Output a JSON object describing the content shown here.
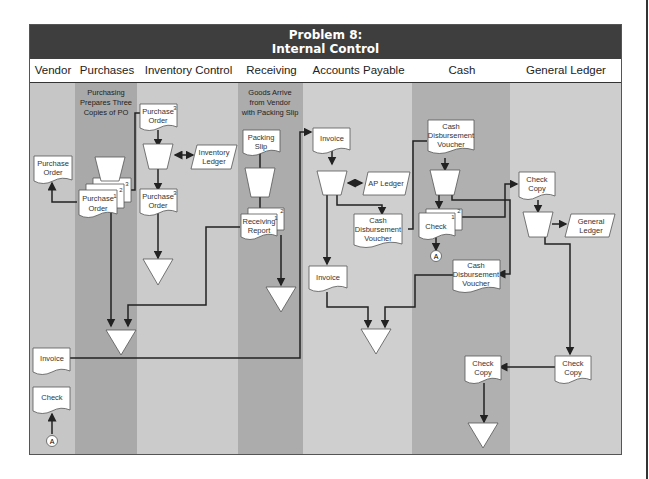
{
  "title": {
    "line1": "Problem 8:",
    "line2": "Internal Control"
  },
  "lanes": [
    {
      "label": "Vendor",
      "x": 29,
      "w": 46,
      "color": "#c6c6c6"
    },
    {
      "label": "Purchases",
      "x": 75,
      "w": 62,
      "color": "#a9a9a9"
    },
    {
      "label": "Inventory Control",
      "x": 137,
      "w": 101,
      "color": "#cbcbcb"
    },
    {
      "label": "Receiving",
      "x": 238,
      "w": 65,
      "color": "#acacac"
    },
    {
      "label": "Accounts Payable",
      "x": 303,
      "w": 109,
      "color": "#cfcfcf"
    },
    {
      "label": "Cash Disbursments",
      "x": 412,
      "w": 98,
      "color": "#b0b0b0"
    },
    {
      "label": "General Ledger",
      "x": 510,
      "w": 112,
      "color": "#cecece"
    }
  ],
  "notes": {
    "purchasing": [
      "Purchasing",
      "Prepares Three",
      "Copies of PO"
    ],
    "receiving": [
      "Goods Arrive",
      "from Vendor",
      "with Packing Slip"
    ]
  },
  "documents": {
    "vendor_po": [
      "Purchase",
      "Order"
    ],
    "purch_po": [
      "Purchase",
      "Order"
    ],
    "purch_po_nums": [
      "1",
      "2",
      "3"
    ],
    "inv_po_top": [
      "Purchase",
      "Order"
    ],
    "inv_po_top_num": "3",
    "inv_po_bottom": [
      "Purchase",
      "Order"
    ],
    "inv_po_bottom_num": "3",
    "packing_slip": [
      "Packing",
      "Slip"
    ],
    "receiving_report": [
      "Receiving",
      "Report"
    ],
    "rr_nums": [
      "1",
      "2"
    ],
    "ap_invoice_top": [
      "Invoice"
    ],
    "ap_cdv": [
      "Cash",
      "Disbursement",
      "Voucher"
    ],
    "ap_invoice_bottom": [
      "Invoice"
    ],
    "cd_cdv_top": [
      "Cash",
      "Disbursement",
      "Voucher"
    ],
    "cd_check": [
      "Check"
    ],
    "cd_check_nums": [
      "1",
      "2"
    ],
    "cd_cdv_bottom": [
      "Cash",
      "Disbursement",
      "Voucher"
    ],
    "cd_check_copy": [
      "Check",
      "Copy"
    ],
    "gl_check_copy_top": [
      "Check",
      "Copy"
    ],
    "gl_check_copy_bottom": [
      "Check",
      "Copy"
    ],
    "vendor_invoice": [
      "Invoice"
    ],
    "vendor_check": [
      "Check"
    ]
  },
  "ledgers": {
    "inventory": [
      "Inventory",
      "Ledger"
    ],
    "ap": [
      "AP Ledger"
    ],
    "general": [
      "General",
      "Ledger"
    ]
  },
  "connectors": {
    "a1": "A",
    "a2": "A"
  }
}
